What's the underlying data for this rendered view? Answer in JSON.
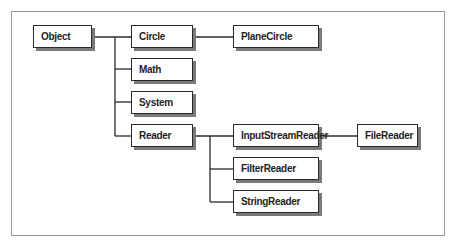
{
  "diagram": {
    "type": "class-hierarchy",
    "nodes": {
      "object": "Object",
      "circle": "Circle",
      "math": "Math",
      "system": "System",
      "reader": "Reader",
      "plane_circle": "PlaneCircle",
      "input_stream_reader": "InputStreamReader",
      "filter_reader": "FilterReader",
      "string_reader": "StringReader",
      "file_reader": "FileReader"
    },
    "edges": [
      [
        "Object",
        "Circle"
      ],
      [
        "Object",
        "Math"
      ],
      [
        "Object",
        "System"
      ],
      [
        "Object",
        "Reader"
      ],
      [
        "Circle",
        "PlaneCircle"
      ],
      [
        "Reader",
        "InputStreamReader"
      ],
      [
        "Reader",
        "FilterReader"
      ],
      [
        "Reader",
        "StringReader"
      ],
      [
        "InputStreamReader",
        "FileReader"
      ]
    ],
    "colors": {
      "box_border": "#2a2a2a",
      "box_shadow": "#7a7a7a",
      "line": "#2a2a2a",
      "frame": "#9a9a9a"
    }
  }
}
